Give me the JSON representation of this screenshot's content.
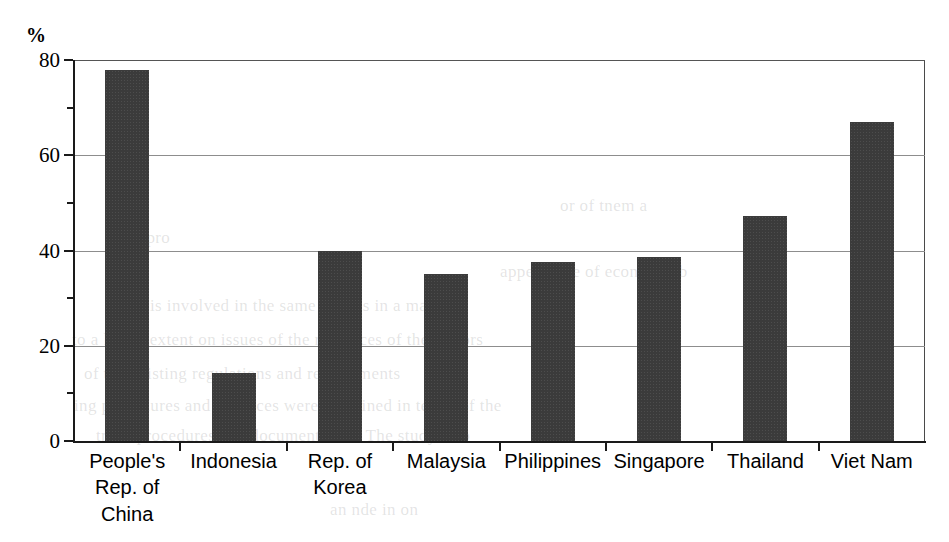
{
  "chart_data": {
    "type": "bar",
    "title": "",
    "subtitle": "",
    "xlabel": "",
    "ylabel": "%",
    "unit_label": "%",
    "ylim": [
      0,
      80
    ],
    "yticks": [
      0,
      20,
      40,
      60,
      80
    ],
    "ytick_labels": [
      "0",
      "20",
      "40",
      "60",
      "80"
    ],
    "yminor_ticks": [
      10,
      30,
      50,
      70
    ],
    "grid": true,
    "grid_axis": "y",
    "legend": "none",
    "bar_color": "#3b3b3b",
    "categories": [
      "People's\nRep. of\nChina",
      "Indonesia",
      "Rep. of\nKorea",
      "Malaysia",
      "Philippines",
      "Singapore",
      "Thailand",
      "Viet Nam"
    ],
    "values": [
      78,
      14.3,
      40,
      35,
      37.6,
      38.7,
      47.3,
      67
    ],
    "series": [
      {
        "name": "",
        "values": [
          78,
          14.3,
          40,
          35,
          37.6,
          38.7,
          47.3,
          67
        ]
      }
    ]
  },
  "ghost_text": {
    "lines": [
      {
        "text": "or of tnem a",
        "x": 560,
        "y": 196
      },
      {
        "text": "le in pro",
        "x": 110,
        "y": 228
      },
      {
        "text": "appearance of economic b",
        "x": 500,
        "y": 262
      },
      {
        "text": "is involved in the same way as in a manu",
        "x": 150,
        "y": 296
      },
      {
        "text": "to a larger extent on issues of the resources of the sectors",
        "x": 72,
        "y": 330
      },
      {
        "text": "of the existing regulations and requirements",
        "x": 84,
        "y": 364
      },
      {
        "text": "ing procedures and practices were examined in terms of the",
        "x": 74,
        "y": 396
      },
      {
        "text": "trade procedures and documentation. The study also",
        "x": 96,
        "y": 426
      },
      {
        "text": "an nde in on",
        "x": 330,
        "y": 500
      }
    ]
  }
}
